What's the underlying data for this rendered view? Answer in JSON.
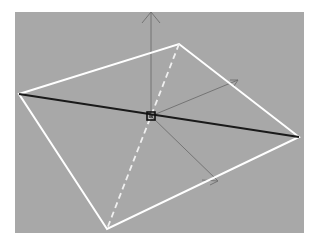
{
  "viewport": {
    "background": "#a8a8a8",
    "label": "3D viewport"
  },
  "scene": {
    "quad": {
      "color": "#ffffff",
      "vertices": [
        [
          19,
          94
        ],
        [
          179,
          44
        ],
        [
          299,
          137
        ],
        [
          107,
          229
        ]
      ]
    },
    "diagonal_solid": {
      "from": [
        19,
        94
      ],
      "to": [
        299,
        137
      ],
      "color": "#1a1a1a"
    },
    "diagonal_dashed": {
      "from": [
        179,
        44
      ],
      "to": [
        107,
        229
      ],
      "color": "#f0f0f0"
    },
    "pivot": {
      "x": 151,
      "y": 116,
      "color": "#111111"
    },
    "axes": [
      {
        "name": "y-axis",
        "from": [
          151,
          116
        ],
        "to": [
          151,
          12
        ],
        "color": "#6e6e6e"
      },
      {
        "name": "x-axis",
        "from": [
          151,
          116
        ],
        "to": [
          238,
          80
        ],
        "color": "#6e6e6e"
      },
      {
        "name": "z-axis",
        "from": [
          151,
          116
        ],
        "to": [
          218,
          181
        ],
        "color": "#6e6e6e"
      }
    ]
  }
}
